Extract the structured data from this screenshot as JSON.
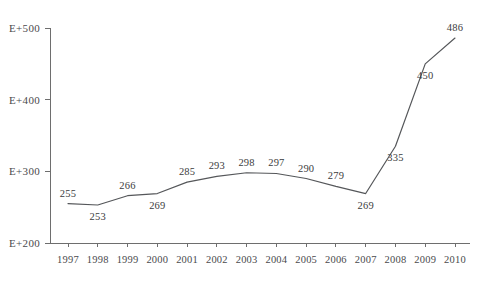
{
  "title": {
    "left_fragment": "",
    "right_fragment": ""
  },
  "chart_data": {
    "type": "line",
    "title": "",
    "xlabel": "",
    "ylabel": "",
    "categories": [
      "1997",
      "1998",
      "1999",
      "2000",
      "2001",
      "2002",
      "2003",
      "2004",
      "2005",
      "2006",
      "2007",
      "2008",
      "2009",
      "2010"
    ],
    "values": [
      255,
      253,
      266,
      269,
      285,
      293,
      298,
      297,
      290,
      279,
      269,
      335,
      450,
      486
    ],
    "point_labels": [
      "255",
      "253",
      "266",
      "269",
      "285",
      "293",
      "298",
      "297",
      "290",
      "279",
      "269",
      "335",
      "450",
      "486"
    ],
    "label_positions": [
      "above",
      "below",
      "above",
      "below",
      "above",
      "above",
      "above",
      "above",
      "above",
      "above",
      "below",
      "below",
      "below",
      "above"
    ],
    "ylim": [
      200,
      500
    ],
    "yticks": [
      200,
      300,
      400,
      500
    ],
    "ytick_labels": [
      "E+200",
      "E+300",
      "E+400",
      "E+500"
    ],
    "grid": false,
    "legend": "none",
    "markers": "none",
    "line_color": "#55575a",
    "axis_color": "#6e6e6e",
    "background_color": "#ffffff"
  }
}
